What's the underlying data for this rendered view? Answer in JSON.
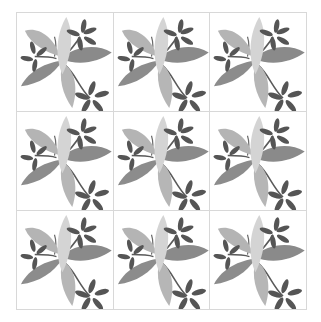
{
  "pattern": {
    "rows": 3,
    "columns": 3,
    "tile_count": 9,
    "motif": "leaf-spray",
    "colors": {
      "background": "#ffffff",
      "grid_line": "#d8d8d8",
      "leaf_light": "#d2d2d2",
      "leaf_mid_light": "#b4b4b4",
      "leaf_mid": "#8a8a8a",
      "leaflet_dark": "#555555",
      "stem": "#5a5a5a"
    }
  }
}
